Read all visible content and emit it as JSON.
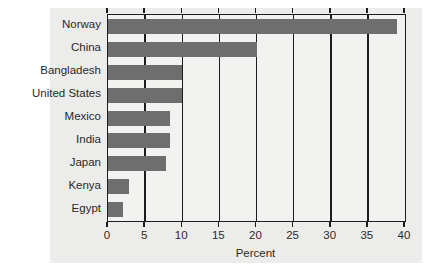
{
  "chart_data": {
    "type": "bar",
    "orientation": "horizontal",
    "title": "",
    "xlabel": "Percent",
    "ylabel": "",
    "xlim": [
      0,
      40
    ],
    "xticks": [
      0,
      5,
      10,
      15,
      20,
      25,
      30,
      35,
      40
    ],
    "xtick_labels": [
      "0",
      "5",
      "10",
      "15",
      "20",
      "25",
      "30",
      "35",
      "40"
    ],
    "grid": "vertical",
    "legend": "none",
    "bar_color": "#6e6e6e",
    "panel_color": "#ececeb",
    "axis_color": "#1d1d1d",
    "categories": [
      "Norway",
      "China",
      "Bangladesh",
      "United States",
      "Mexico",
      "India",
      "Japan",
      "Kenya",
      "Egypt"
    ],
    "values": [
      38.9,
      20.1,
      10.0,
      10.0,
      8.3,
      8.3,
      7.8,
      2.8,
      2.0
    ]
  }
}
